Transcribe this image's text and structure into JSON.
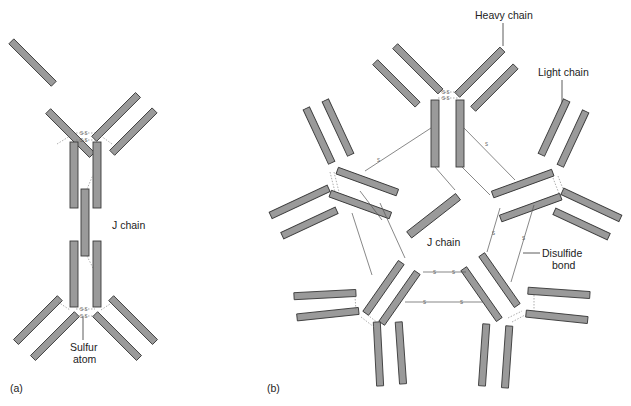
{
  "panels": {
    "a": {
      "label": "(a)",
      "title": "Dimeric antibody (IgA)",
      "j_chain_label": "J chain",
      "sulfur_label_line1": "Sulfur",
      "sulfur_label_line2": "atom"
    },
    "b": {
      "label": "(b)",
      "title": "Pentameric antibody (IgM)",
      "heavy_chain_label": "Heavy chain",
      "light_chain_label": "Light chain",
      "j_chain_label": "J chain",
      "disulfide_label_line1": "Disulfide",
      "disulfide_label_line2": "bond"
    }
  },
  "bond_symbol": "S",
  "bond_pair": "S–S",
  "colors": {
    "chain_fill": "#9a9a9a",
    "chain_stroke": "#3a3a3a",
    "bond_line": "#555555",
    "text": "#222222",
    "background": "#ffffff"
  }
}
